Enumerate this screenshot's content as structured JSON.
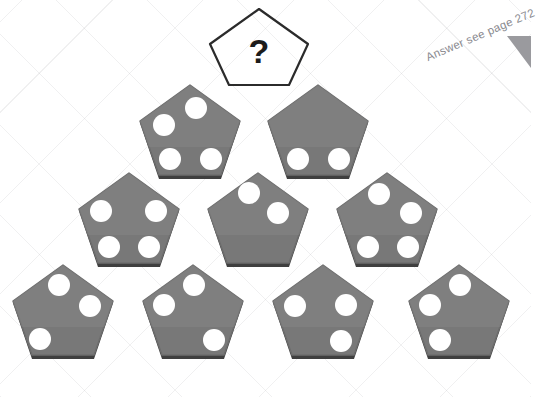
{
  "page": {
    "background_color": "#ffffff",
    "grid_line_color": "#96969b",
    "tile_fill_color": "#787878",
    "tile_edge_color": "#4a4a4a",
    "dot_color": "#ffffff",
    "note_color": "#8a8a8f",
    "wedge_color": "#9a9a9e"
  },
  "answer_note": {
    "text": "Answer see page 272",
    "rotation_degrees": -23
  },
  "question_tile": {
    "label": "?",
    "outline_color": "#2b2b2b",
    "fill": "none",
    "dot_count": null
  },
  "puzzle": {
    "shape": "pentagon",
    "arrangement": "pyramid",
    "row_counts": [
      1,
      2,
      3,
      4
    ],
    "dot_positions_key": [
      "top",
      "upper-right",
      "lower-right",
      "lower-left",
      "upper-left"
    ],
    "rows": [
      {
        "row": 1,
        "tiles": [
          {
            "name": "question-tile",
            "dot_count": null,
            "dots": [],
            "unknown": true
          }
        ]
      },
      {
        "row": 2,
        "tiles": [
          {
            "name": "tile-r2-c1",
            "dot_count": 4,
            "dots": [
              "top",
              "upper-left",
              "lower-left",
              "lower-right"
            ]
          },
          {
            "name": "tile-r2-c2",
            "dot_count": 2,
            "dots": [
              "lower-left",
              "lower-right"
            ]
          }
        ]
      },
      {
        "row": 3,
        "tiles": [
          {
            "name": "tile-r3-c1",
            "dot_count": 4,
            "dots": [
              "upper-left",
              "upper-right",
              "lower-left",
              "lower-right"
            ]
          },
          {
            "name": "tile-r3-c2",
            "dot_count": 2,
            "dots": [
              "top",
              "upper-right"
            ]
          },
          {
            "name": "tile-r3-c3",
            "dot_count": 4,
            "dots": [
              "top",
              "upper-right",
              "lower-left",
              "lower-right"
            ]
          }
        ]
      },
      {
        "row": 4,
        "tiles": [
          {
            "name": "tile-r4-c1",
            "dot_count": 3,
            "dots": [
              "top",
              "upper-right",
              "lower-left"
            ]
          },
          {
            "name": "tile-r4-c2",
            "dot_count": 3,
            "dots": [
              "top",
              "upper-left",
              "lower-right"
            ]
          },
          {
            "name": "tile-r4-c3",
            "dot_count": 3,
            "dots": [
              "upper-left",
              "upper-right",
              "lower-right"
            ]
          },
          {
            "name": "tile-r4-c4",
            "dot_count": 3,
            "dots": [
              "top",
              "upper-left",
              "lower-left"
            ]
          }
        ]
      }
    ]
  }
}
